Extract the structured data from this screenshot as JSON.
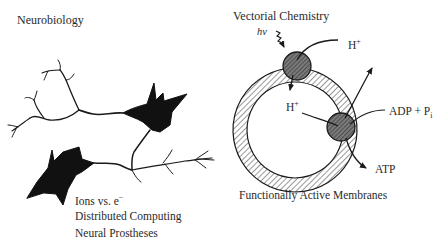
{
  "panels": {
    "left": {
      "title": "Neurobiology",
      "illustration": "neuron-network",
      "captions": [
        "Ions vs. e",
        "Distributed Computing",
        "Neural Prostheses"
      ],
      "caption_superscript": "−"
    },
    "right": {
      "title": "Vectorial Chemistry",
      "illustration": "membrane-vesicle",
      "labels": {
        "light": "hv",
        "proton_out": "H",
        "proton_out_sup": "+",
        "proton_in": "H",
        "proton_in_sup": "+",
        "adp": "ADP + P",
        "adp_sub": "i",
        "atp": "ATP"
      },
      "caption": "Functionally Active Membranes"
    }
  },
  "colors": {
    "ink": "#1a1a1a",
    "protein_fill": "#6e6e6e",
    "background": "#ffffff"
  }
}
